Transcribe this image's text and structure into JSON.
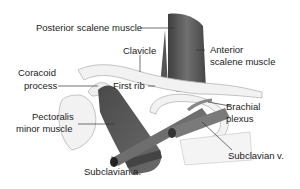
{
  "figure": {
    "labels": {
      "posterior_scalene": "Posterior scalene muscle",
      "clavicle": "Clavicle",
      "anterior_scalene_1": "Anterior",
      "anterior_scalene_2": "scalene muscle",
      "coracoid_1": "Coracoid",
      "coracoid_2": "process",
      "first_rib": "First rib",
      "brachial_1": "Brachial",
      "brachial_2": "plexus",
      "pectoralis_1": "Pectoralis",
      "pectoralis_2": "minor muscle",
      "subclavian_a": "Subclavian a.",
      "subclavian_v": "Subclavian v."
    },
    "colors": {
      "muscle": "#5a5a5a",
      "bone": "#f2f2f2",
      "bone_outline": "#b5b5b5",
      "vessel": "#6e6e6e",
      "text": "#222222"
    }
  }
}
